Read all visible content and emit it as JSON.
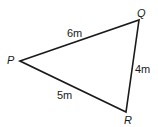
{
  "diagram": {
    "type": "triangle",
    "vertices": [
      {
        "name": "P",
        "x": 20,
        "y": 61
      },
      {
        "name": "Q",
        "x": 139,
        "y": 20
      },
      {
        "name": "R",
        "x": 126,
        "y": 112
      }
    ],
    "sides": [
      {
        "from": "P",
        "to": "Q",
        "label": "6m"
      },
      {
        "from": "Q",
        "to": "R",
        "label": "4m"
      },
      {
        "from": "P",
        "to": "R",
        "label": "5m"
      }
    ],
    "stroke_color": "#1a1a1a"
  }
}
